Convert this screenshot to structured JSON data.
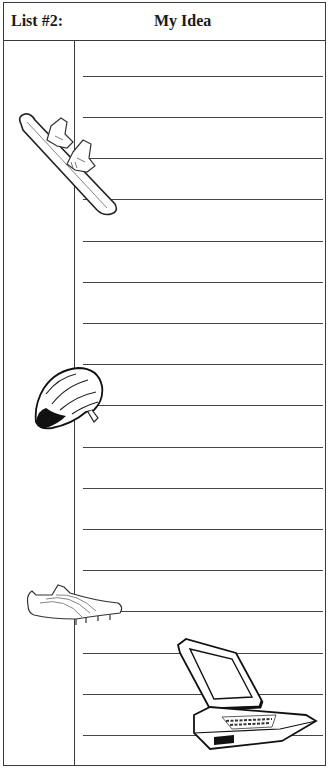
{
  "header": {
    "list_label": "List #2:",
    "title": "My Idea"
  },
  "rules_y": [
    75,
    116,
    157,
    198,
    240,
    281,
    322,
    363,
    404,
    446,
    487,
    528,
    569,
    610,
    652,
    693,
    734
  ],
  "clipart": [
    {
      "name": "snowboard-icon",
      "x": 17,
      "y": 112,
      "w": 102,
      "h": 104
    },
    {
      "name": "bike-helmet-icon",
      "x": 32,
      "y": 364,
      "w": 72,
      "h": 68
    },
    {
      "name": "track-shoe-icon",
      "x": 26,
      "y": 583,
      "w": 98,
      "h": 45
    },
    {
      "name": "laptop-icon",
      "x": 176,
      "y": 637,
      "w": 144,
      "h": 116
    }
  ],
  "colors": {
    "line": "#3a3a3a",
    "paper": "#ffffff"
  }
}
